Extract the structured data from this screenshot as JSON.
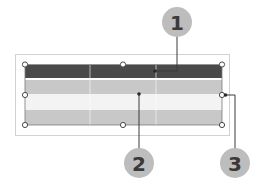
{
  "diagram": {
    "colors": {
      "header_row": "#4a4a4a",
      "band_row": "#c8c8c8",
      "light_row": "#f2f2f2",
      "frame": "#cfcfcf",
      "callout_fill": "#bdbdbd",
      "leader": "#3a3a3a"
    },
    "table": {
      "rows": 4,
      "columns": 3
    },
    "callouts": [
      {
        "label": "1",
        "target": "header-row"
      },
      {
        "label": "2",
        "target": "table-body"
      },
      {
        "label": "3",
        "target": "resize-handle-right"
      }
    ]
  }
}
